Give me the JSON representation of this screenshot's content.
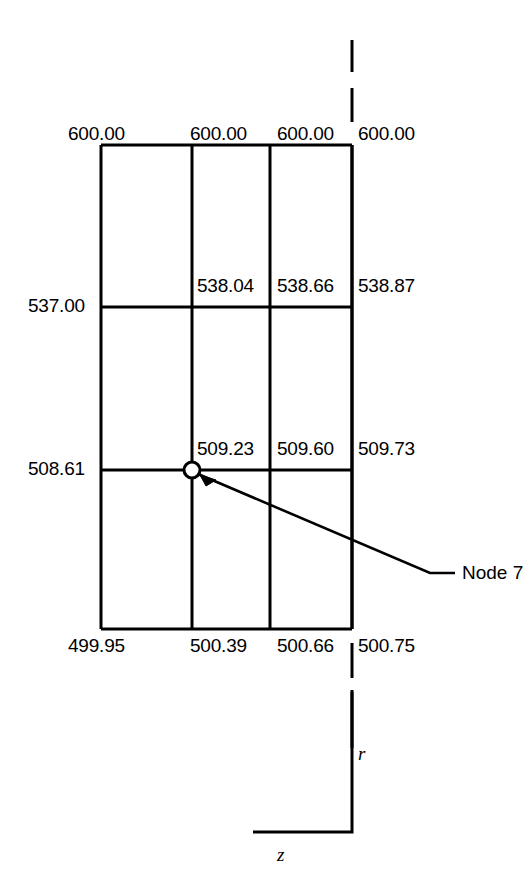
{
  "figure": {
    "clipped_caption": "Appendix",
    "type": "finite-element-mesh-nodal-values"
  },
  "mesh": {
    "columns": 3,
    "rows": 3,
    "vertical_line_x": [
      101,
      192,
      270,
      352
    ],
    "horizontal_line_y": [
      145,
      307,
      470,
      629
    ]
  },
  "row_top": {
    "values": [
      "600.00",
      "600.00",
      "600.00",
      "600.00"
    ]
  },
  "row_second": {
    "values": [
      "537.00",
      "538.04",
      "538.66",
      "538.87"
    ]
  },
  "row_third": {
    "values": [
      "508.61",
      "509.23",
      "509.60",
      "509.73"
    ]
  },
  "row_bottom": {
    "values": [
      "499.95",
      "500.39",
      "500.66",
      "500.75"
    ]
  },
  "node": {
    "label": "Node 7",
    "marker": "open-circle",
    "x": 192,
    "y": 470
  },
  "axes": {
    "vertical_label": "r",
    "horizontal_label": "z"
  },
  "centerline": {
    "style": "dashed",
    "x": 352
  },
  "colors": {
    "stroke": "#000000",
    "background": "#ffffff"
  }
}
